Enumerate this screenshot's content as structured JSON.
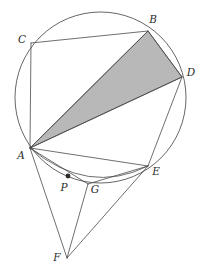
{
  "figure": {
    "width": 203,
    "height": 270,
    "background_color": "#ffffff",
    "stroke_color": "#4a4a4a",
    "shade_color": "#b8b8b8",
    "label_color": "#2b2b2b"
  },
  "circle": {
    "name": "circumcircle",
    "cx": 100.5,
    "cy": 97.5,
    "r": 85.5
  },
  "points": {
    "A": {
      "label": "A",
      "x": 30,
      "y": 148,
      "label_x": 21,
      "label_y": 156
    },
    "B": {
      "label": "B",
      "x": 148,
      "y": 31,
      "label_x": 153,
      "label_y": 20
    },
    "C": {
      "label": "C",
      "x": 31,
      "y": 43,
      "label_x": 22,
      "label_y": 40
    },
    "D": {
      "label": "D",
      "x": 182,
      "y": 77,
      "label_x": 191,
      "label_y": 73
    },
    "E": {
      "label": "E",
      "x": 148,
      "y": 166,
      "label_x": 156,
      "label_y": 172
    },
    "F": {
      "label": "F",
      "x": 67,
      "y": 258,
      "label_x": 57,
      "label_y": 258
    },
    "G": {
      "label": "G",
      "x": 88,
      "y": 184,
      "label_x": 95,
      "label_y": 190
    },
    "P": {
      "label": "P",
      "x": 68,
      "y": 176,
      "label_x": 64,
      "label_y": 188
    }
  },
  "shaded_triangle": {
    "name": "triangle-ABD",
    "vertices": "30,148 148,31 182,77",
    "fill": "#b8b8b8"
  },
  "segments": [
    {
      "name": "segment-CB",
      "from": "C",
      "to": "B",
      "d": "M 31 43 L 148 31"
    },
    {
      "name": "segment-CA",
      "from": "C",
      "to": "A",
      "d": "M 31 43 L 30 148"
    },
    {
      "name": "segment-AB",
      "from": "A",
      "to": "B",
      "d": "M 30 148 L 148 31"
    },
    {
      "name": "segment-AD",
      "from": "A",
      "to": "D",
      "d": "M 30 148 L 182 77"
    },
    {
      "name": "segment-BD",
      "from": "B",
      "to": "D",
      "d": "M 148 31 L 182 77"
    },
    {
      "name": "segment-AE",
      "from": "A",
      "to": "E",
      "d": "M 30 148 L 148 166"
    },
    {
      "name": "segment-AG",
      "from": "A",
      "to": "G",
      "d": "M 30 148 L 88 184"
    },
    {
      "name": "segment-AF",
      "from": "A",
      "to": "F",
      "d": "M 30 148 L 67 258"
    },
    {
      "name": "segment-DE",
      "from": "D",
      "to": "E",
      "d": "M 182 77 L 148 166"
    },
    {
      "name": "segment-GE",
      "from": "G",
      "to": "E",
      "d": "M 88 184 L 148 166"
    },
    {
      "name": "segment-GF",
      "from": "G",
      "to": "F",
      "d": "M 88 184 L 67 258"
    },
    {
      "name": "segment-EF",
      "from": "E",
      "to": "F",
      "d": "M 148 166 L 67 258"
    },
    {
      "name": "segment-DF-upper",
      "from": "D",
      "to": "F",
      "d": "M 182 77 L 148 166"
    }
  ],
  "arcs": [
    {
      "name": "arc-A-to-E-through-P",
      "d": "M 30 148 Q 88 196 148 166"
    }
  ],
  "markers": [
    {
      "name": "point-marker-P",
      "x": 68,
      "y": 176,
      "r": 2.4,
      "fill": "#2b2b2b"
    }
  ]
}
